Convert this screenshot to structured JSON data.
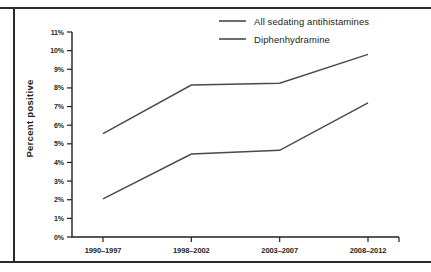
{
  "figure": {
    "y_axis_title": "Percent positive"
  },
  "chart_data": {
    "type": "line",
    "title": "",
    "xlabel": "",
    "ylabel": "Percent positive",
    "categories": [
      "1990–1997",
      "1998–2002",
      "2003–2007",
      "2008–2012"
    ],
    "ylim": [
      0,
      11
    ],
    "yticks": [
      0,
      1,
      2,
      3,
      4,
      5,
      6,
      7,
      8,
      9,
      10,
      11
    ],
    "ytick_labels": [
      "0%",
      "1%",
      "2%",
      "3%",
      "4%",
      "5%",
      "6%",
      "7%",
      "8%",
      "9%",
      "10%",
      "11%"
    ],
    "grid": false,
    "legend_position": "top-right",
    "series": [
      {
        "name": "All sedating antihistamines",
        "color": "#4a4a4a",
        "values": [
          5.55,
          8.15,
          8.25,
          9.8
        ]
      },
      {
        "name": "Diphenhydramine",
        "color": "#4a4a4a",
        "values": [
          2.05,
          4.45,
          4.65,
          7.2
        ]
      }
    ]
  }
}
